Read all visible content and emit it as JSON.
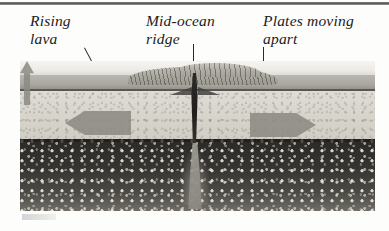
{
  "figure": {
    "labels": {
      "rising_lava": "Rising\nlava",
      "mid_ocean_ridge": "Mid-ocean\nridge",
      "plates_moving_apart": "Plates moving\napart"
    },
    "leaders": {
      "rising_lava": "diagonal-leader-line",
      "mid_ocean_ridge": "vertical-leader-line",
      "plates_moving_apart": "vertical-leader-line"
    },
    "arrows": {
      "left": "plate-motion-arrow-left",
      "right": "plate-motion-arrow-right",
      "magma": "magma-upwelling-arrow"
    },
    "layers": {
      "water": "ocean-water",
      "crust_upper": "upper-crust",
      "crust_lower": "lower-crust",
      "mantle": "mantle",
      "rift": "central-rift",
      "magma": "magma-plume",
      "ridge_crest": "ridge-crest-hills"
    },
    "colors": {
      "ink": "#1b1b1b",
      "water": "#f2f0ea",
      "crust_upper": "#a9a7a0",
      "crust_lower": "#d8d5cd",
      "mantle": "#33312d",
      "arrow": "#8e8c85",
      "rift": "#262421"
    }
  }
}
